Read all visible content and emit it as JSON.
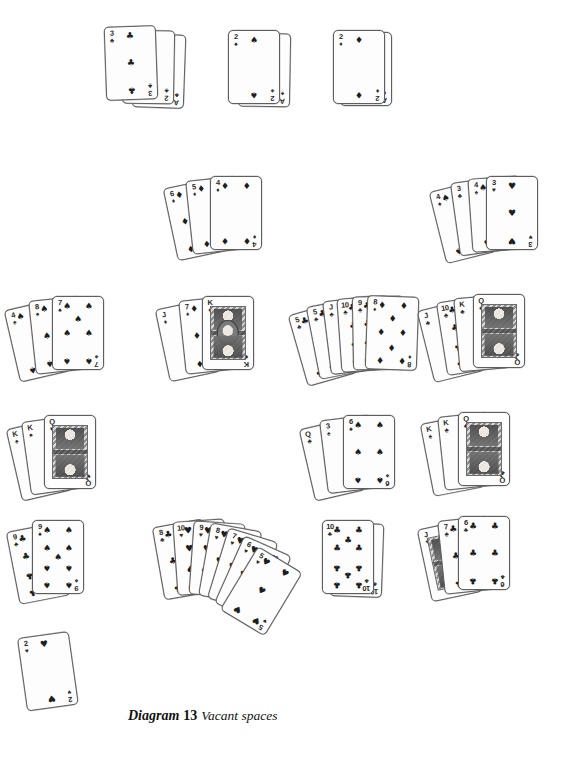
{
  "figure": {
    "caption_lead": "Diagram",
    "caption_number": "13",
    "caption_text": "Vacant spaces",
    "background_color": "#ffffff",
    "ink_color": "#1d1d1d",
    "card_face_color": "#fdfdfd",
    "card_border_color": "#5e5e5e",
    "medium": "black-and-white printed diagram of playing cards"
  },
  "suit_glyphs": {
    "spade": "♠",
    "heart": "♥",
    "club": "♣",
    "diamond": "♦"
  },
  "piles": [
    {
      "id": "pile-1",
      "row": 1,
      "x": 106,
      "y": 26,
      "cards": [
        {
          "rank": "A",
          "suit": "club",
          "face_up": true,
          "kind": "court_none",
          "dx": 26,
          "dy": 8,
          "rot": 2
        },
        {
          "rank": "2",
          "suit": "club",
          "face_up": true,
          "kind": "pip",
          "dx": 16,
          "dy": 4,
          "rot": 1
        },
        {
          "rank": "3",
          "suit": "club",
          "face_up": true,
          "kind": "pip",
          "dx": 0,
          "dy": 0,
          "rot": -2
        }
      ]
    },
    {
      "id": "pile-2",
      "row": 1,
      "x": 228,
      "y": 30,
      "cards": [
        {
          "rank": "A",
          "suit": "spade",
          "face_up": true,
          "kind": "pip",
          "dx": 10,
          "dy": 3,
          "rot": 1
        },
        {
          "rank": "2",
          "suit": "spade",
          "face_up": true,
          "kind": "pip",
          "dx": 0,
          "dy": 0,
          "rot": 0
        }
      ]
    },
    {
      "id": "pile-3",
      "row": 1,
      "x": 333,
      "y": 30,
      "cards": [
        {
          "rank": "A",
          "suit": "diamond",
          "face_up": true,
          "kind": "pip",
          "dx": 7,
          "dy": 2,
          "rot": 0
        },
        {
          "rank": "2",
          "suit": "diamond",
          "face_up": true,
          "kind": "pip",
          "dx": 0,
          "dy": 0,
          "rot": 0
        }
      ]
    },
    {
      "id": "pile-4",
      "row": 2,
      "x": 176,
      "y": 176,
      "cards": [
        {
          "rank": "6",
          "suit": "diamond",
          "face_up": true,
          "kind": "pip",
          "dx": 0,
          "dy": 6,
          "rot": -12
        },
        {
          "rank": "5",
          "suit": "diamond",
          "face_up": true,
          "kind": "pip",
          "dx": 16,
          "dy": 2,
          "rot": -6
        },
        {
          "rank": "4",
          "suit": "diamond",
          "face_up": true,
          "kind": "pip",
          "dx": 34,
          "dy": 0,
          "rot": 0
        }
      ]
    },
    {
      "id": "pile-5",
      "row": 2,
      "x": 444,
      "y": 176,
      "cards": [
        {
          "rank": "4",
          "suit": "spade",
          "face_up": true,
          "kind": "pip",
          "dx": 0,
          "dy": 8,
          "rot": -14
        },
        {
          "rank": "3",
          "suit": "club",
          "face_up": true,
          "kind": "pip",
          "dx": 15,
          "dy": 3,
          "rot": -8
        },
        {
          "rank": "4",
          "suit": "spade",
          "face_up": true,
          "kind": "pip",
          "dx": 28,
          "dy": 1,
          "rot": -4
        },
        {
          "rank": "3",
          "suit": "heart",
          "face_up": true,
          "kind": "pip",
          "dx": 42,
          "dy": 0,
          "rot": 0
        }
      ]
    },
    {
      "id": "pile-6",
      "row": 3,
      "x": 18,
      "y": 296,
      "cards": [
        {
          "rank": "4",
          "suit": "spade",
          "face_up": true,
          "kind": "pip",
          "dx": 0,
          "dy": 7,
          "rot": -13
        },
        {
          "rank": "8",
          "suit": "spade",
          "face_up": true,
          "kind": "pip",
          "dx": 17,
          "dy": 2,
          "rot": -6
        },
        {
          "rank": "7",
          "suit": "spade",
          "face_up": true,
          "kind": "pip",
          "dx": 34,
          "dy": 0,
          "rot": 0
        }
      ]
    },
    {
      "id": "pile-7",
      "row": 3,
      "x": 168,
      "y": 296,
      "cards": [
        {
          "rank": "J",
          "suit": "diamond",
          "face_up": true,
          "kind": "pip",
          "dx": 0,
          "dy": 7,
          "rot": -12
        },
        {
          "rank": "7",
          "suit": "diamond",
          "face_up": true,
          "kind": "pip",
          "dx": 17,
          "dy": 2,
          "rot": -6
        },
        {
          "rank": "K",
          "suit": "diamond",
          "face_up": true,
          "kind": "court",
          "dx": 34,
          "dy": 0,
          "rot": 0
        }
      ]
    },
    {
      "id": "pile-8",
      "row": 3,
      "x": 305,
      "y": 296,
      "cards": [
        {
          "rank": "5",
          "suit": "club",
          "face_up": true,
          "kind": "pip",
          "dx": 0,
          "dy": 10,
          "rot": -16
        },
        {
          "rank": "5",
          "suit": "club",
          "face_up": true,
          "kind": "pip",
          "dx": 13,
          "dy": 5,
          "rot": -11
        },
        {
          "rank": "J",
          "suit": "club",
          "face_up": true,
          "kind": "pip",
          "dx": 25,
          "dy": 2,
          "rot": -7
        },
        {
          "rank": "10",
          "suit": "club",
          "face_up": true,
          "kind": "pip",
          "dx": 36,
          "dy": 1,
          "rot": -4
        },
        {
          "rank": "9",
          "suit": "club",
          "face_up": true,
          "kind": "pip",
          "dx": 48,
          "dy": 0,
          "rot": -1
        },
        {
          "rank": "8",
          "suit": "diamond",
          "face_up": true,
          "kind": "pip",
          "dx": 60,
          "dy": 0,
          "rot": 2
        }
      ]
    },
    {
      "id": "pile-9",
      "row": 3,
      "x": 432,
      "y": 294,
      "cards": [
        {
          "rank": "J",
          "suit": "club",
          "face_up": true,
          "kind": "pip",
          "dx": 0,
          "dy": 9,
          "rot": -14
        },
        {
          "rank": "10",
          "suit": "club",
          "face_up": true,
          "kind": "pip",
          "dx": 14,
          "dy": 4,
          "rot": -9
        },
        {
          "rank": "K",
          "suit": "club",
          "face_up": true,
          "kind": "pip",
          "dx": 27,
          "dy": 2,
          "rot": -5
        },
        {
          "rank": "Q",
          "suit": "spade",
          "face_up": true,
          "kind": "court",
          "dx": 41,
          "dy": 0,
          "rot": 0
        }
      ]
    },
    {
      "id": "pile-10",
      "row": 4,
      "x": 20,
      "y": 415,
      "cards": [
        {
          "rank": "K",
          "suit": "spade",
          "face_up": true,
          "kind": "pip",
          "dx": 0,
          "dy": 7,
          "rot": -13
        },
        {
          "rank": "K",
          "suit": "spade",
          "face_up": true,
          "kind": "pip",
          "dx": 10,
          "dy": 3,
          "rot": -8
        },
        {
          "rank": "Q",
          "suit": "heart",
          "face_up": true,
          "kind": "court",
          "dx": 24,
          "dy": 0,
          "rot": 0
        }
      ]
    },
    {
      "id": "pile-11",
      "row": 4,
      "x": 313,
      "y": 415,
      "cards": [
        {
          "rank": "Q",
          "suit": "club",
          "face_up": true,
          "kind": "pip",
          "dx": 0,
          "dy": 7,
          "rot": -13
        },
        {
          "rank": "3",
          "suit": "spade",
          "face_up": true,
          "kind": "pip",
          "dx": 14,
          "dy": 2,
          "rot": -7
        },
        {
          "rank": "6",
          "suit": "spade",
          "face_up": true,
          "kind": "pip",
          "dx": 30,
          "dy": 0,
          "rot": 0
        }
      ]
    },
    {
      "id": "pile-12",
      "row": 4,
      "x": 432,
      "y": 412,
      "cards": [
        {
          "rank": "K",
          "suit": "spade",
          "face_up": true,
          "kind": "pip",
          "dx": 0,
          "dy": 6,
          "rot": -11
        },
        {
          "rank": "K",
          "suit": "club",
          "face_up": true,
          "kind": "pip",
          "dx": 12,
          "dy": 2,
          "rot": -6
        },
        {
          "rank": "Q",
          "suit": "club",
          "face_up": true,
          "kind": "court",
          "dx": 26,
          "dy": 0,
          "rot": 0
        }
      ]
    },
    {
      "id": "pile-13",
      "row": 5,
      "x": 18,
      "y": 520,
      "cards": [
        {
          "rank": "9",
          "suit": "club",
          "face_up": true,
          "kind": "pip",
          "dx": 0,
          "dy": 6,
          "rot": -11
        },
        {
          "rank": "9",
          "suit": "spade",
          "face_up": true,
          "kind": "pip",
          "dx": 14,
          "dy": 0,
          "rot": 0
        }
      ]
    },
    {
      "id": "pile-14",
      "row": 5,
      "x": 163,
      "y": 518,
      "cards": [
        {
          "rank": "8",
          "suit": "club",
          "face_up": true,
          "kind": "pip",
          "dx": 0,
          "dy": 4,
          "rot": -10
        },
        {
          "rank": "10",
          "suit": "heart",
          "face_up": true,
          "kind": "pip",
          "dx": 14,
          "dy": 2,
          "rot": -4
        },
        {
          "rank": "9",
          "suit": "heart",
          "face_up": true,
          "kind": "pip",
          "dx": 26,
          "dy": 4,
          "rot": 4
        },
        {
          "rank": "8",
          "suit": "heart",
          "face_up": true,
          "kind": "pip",
          "dx": 36,
          "dy": 8,
          "rot": 10
        },
        {
          "rank": "7",
          "suit": "heart",
          "face_up": true,
          "kind": "pip",
          "dx": 45,
          "dy": 14,
          "rot": 17
        },
        {
          "rank": "6",
          "suit": "heart",
          "face_up": true,
          "kind": "pip",
          "dx": 52,
          "dy": 22,
          "rot": 24
        },
        {
          "rank": "5",
          "suit": "heart",
          "face_up": true,
          "kind": "pip",
          "dx": 57,
          "dy": 32,
          "rot": 31
        }
      ]
    },
    {
      "id": "pile-15",
      "row": 5,
      "x": 322,
      "y": 520,
      "cards": [
        {
          "rank": "10",
          "suit": "club",
          "face_up": true,
          "kind": "pip",
          "dx": 8,
          "dy": 3,
          "rot": 2
        },
        {
          "rank": "10",
          "suit": "club",
          "face_up": true,
          "kind": "pip",
          "dx": 0,
          "dy": 0,
          "rot": 0
        }
      ]
    },
    {
      "id": "pile-16",
      "row": 5,
      "x": 430,
      "y": 516,
      "cards": [
        {
          "rank": "J",
          "suit": "heart",
          "face_up": true,
          "kind": "court",
          "dx": 0,
          "dy": 7,
          "rot": -12
        },
        {
          "rank": "7",
          "suit": "club",
          "face_up": true,
          "kind": "pip",
          "dx": 14,
          "dy": 2,
          "rot": -6
        },
        {
          "rank": "6",
          "suit": "club",
          "face_up": true,
          "kind": "pip",
          "dx": 28,
          "dy": 0,
          "rot": 0
        }
      ]
    },
    {
      "id": "pile-17",
      "row": 6,
      "x": 26,
      "y": 634,
      "cards": [
        {
          "rank": "2",
          "suit": "heart",
          "face_up": true,
          "kind": "pip",
          "dx": 0,
          "dy": 0,
          "rot": -8
        }
      ]
    }
  ],
  "card_geometry": {
    "width": 52,
    "height": 74
  },
  "caption_position": {
    "x": 128,
    "y": 706
  }
}
